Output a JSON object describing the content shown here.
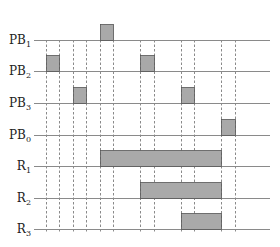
{
  "diagram": {
    "type": "timing-diagram",
    "colors": {
      "baseline": "#8a8a8a",
      "pulse_fill": "#a9a9a9",
      "pulse_stroke": "#555555",
      "dashed": "#8a8a8a",
      "label": "#222222"
    },
    "x_range": [
      34,
      270
    ],
    "guide_y_range": [
      40,
      233
    ],
    "guides_x": [
      46,
      59,
      73,
      86,
      100,
      113,
      140,
      154,
      181,
      194,
      221,
      235
    ],
    "pulse_height": 16,
    "signals": [
      {
        "name": "PB",
        "sub": "1",
        "y": 40,
        "pulses": [
          [
            100,
            113
          ]
        ]
      },
      {
        "name": "PB",
        "sub": "2",
        "y": 71,
        "pulses": [
          [
            46,
            59
          ],
          [
            140,
            154
          ]
        ]
      },
      {
        "name": "PB",
        "sub": "3",
        "y": 103,
        "pulses": [
          [
            73,
            86
          ],
          [
            181,
            194
          ]
        ]
      },
      {
        "name": "PB",
        "sub": "0",
        "y": 135,
        "pulses": [
          [
            221,
            235
          ]
        ]
      },
      {
        "name": "R",
        "sub": "1",
        "y": 166,
        "pulses": [
          [
            100,
            221
          ]
        ]
      },
      {
        "name": "R",
        "sub": "2",
        "y": 198,
        "pulses": [
          [
            140,
            221
          ]
        ]
      },
      {
        "name": "R",
        "sub": "3",
        "y": 229,
        "pulses": [
          [
            181,
            221
          ]
        ]
      }
    ]
  }
}
